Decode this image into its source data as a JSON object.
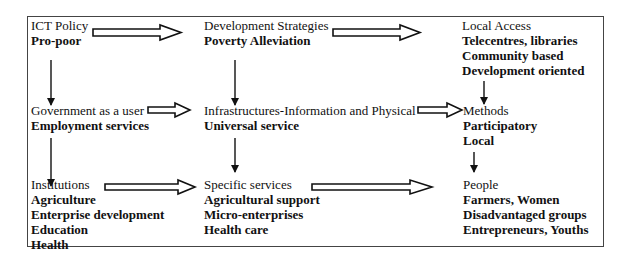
{
  "diagram": {
    "nodes": [
      {
        "id": "ict-policy",
        "heading": "ICT Policy",
        "items": [
          "Pro-poor"
        ]
      },
      {
        "id": "development-strategies",
        "heading": "Development Strategies",
        "items": [
          "Poverty Alleviation"
        ]
      },
      {
        "id": "local-access",
        "heading": "Local Access",
        "items": [
          "Telecentres, libraries",
          "Community based",
          "Development oriented"
        ]
      },
      {
        "id": "government-as-user",
        "heading": "Government as a user",
        "items": [
          "Employment services"
        ]
      },
      {
        "id": "infrastructures",
        "heading": "Infrastructures-Information and Physical",
        "items": [
          "Universal service"
        ]
      },
      {
        "id": "methods",
        "heading": "Methods",
        "items": [
          "Participatory",
          "Local"
        ]
      },
      {
        "id": "institutions",
        "heading": "Institutions",
        "items": [
          "Agriculture",
          "Enterprise development",
          "Education",
          "Health"
        ]
      },
      {
        "id": "specific-services",
        "heading": "Specific services",
        "items": [
          "Agricultural support",
          "Micro-enterprises",
          "Health care"
        ]
      },
      {
        "id": "people",
        "heading": "People",
        "items": [
          "Farmers, Women",
          "Disadvantaged groups",
          "Entrepreneurs, Youths"
        ]
      }
    ],
    "edges": [
      {
        "from": "ict-policy",
        "to": "development-strategies",
        "style": "hollow"
      },
      {
        "from": "development-strategies",
        "to": "local-access",
        "style": "hollow"
      },
      {
        "from": "government-as-user",
        "to": "infrastructures",
        "style": "hollow"
      },
      {
        "from": "infrastructures",
        "to": "methods",
        "style": "hollow"
      },
      {
        "from": "institutions",
        "to": "specific-services",
        "style": "hollow"
      },
      {
        "from": "specific-services",
        "to": "people",
        "style": "hollow"
      },
      {
        "from": "ict-policy",
        "to": "government-as-user",
        "style": "line"
      },
      {
        "from": "government-as-user",
        "to": "institutions",
        "style": "line"
      },
      {
        "from": "development-strategies",
        "to": "infrastructures",
        "style": "line"
      },
      {
        "from": "infrastructures",
        "to": "specific-services",
        "style": "line"
      },
      {
        "from": "local-access",
        "to": "methods",
        "style": "line"
      },
      {
        "from": "methods",
        "to": "people",
        "style": "line"
      }
    ],
    "colors": {
      "line": "#111111",
      "border": "#444444",
      "background": "#ffffff"
    }
  }
}
